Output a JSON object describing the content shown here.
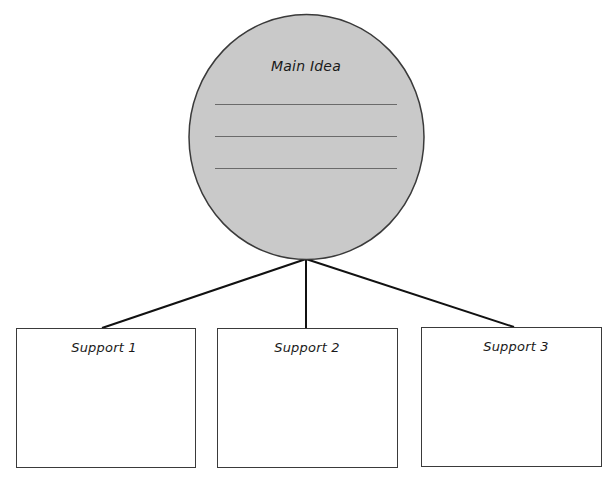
{
  "main_idea": {
    "title": "Main Idea",
    "line_count": 3,
    "fill_color": "#c9c9c9",
    "stroke_color": "#3a3a3a"
  },
  "supports": [
    {
      "label": "Support 1"
    },
    {
      "label": "Support 2"
    },
    {
      "label": "Support 3"
    }
  ],
  "connector_color": "#111111"
}
